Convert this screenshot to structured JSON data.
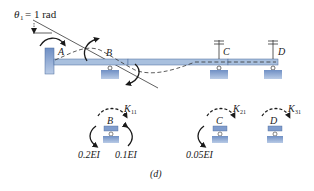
{
  "diagram": {
    "caption": "(d)",
    "rotation_label": {
      "symbol": "θ",
      "subscript": "1",
      "text": "= 1 rad"
    },
    "beam": {
      "nodes": [
        {
          "id": "A",
          "label": "A",
          "support": "fixed"
        },
        {
          "id": "B",
          "label": "B",
          "support": "roller"
        },
        {
          "id": "C",
          "label": "C",
          "support": "roller-restrained"
        },
        {
          "id": "D",
          "label": "D",
          "support": "roller-restrained"
        }
      ],
      "colors": {
        "beam": "#9fb8d8",
        "beam_edge": "#4a6a9a",
        "support": "#7f9ccc",
        "line": "#1a1a1a"
      }
    },
    "free_bodies": [
      {
        "node": "B",
        "label": "B",
        "k_symbol": "K",
        "k_subscript": "11",
        "moments": [
          "0.2EI",
          "0.1EI"
        ]
      },
      {
        "node": "C",
        "label": "C",
        "k_symbol": "K",
        "k_subscript": "21",
        "moments": [
          "0.05EI"
        ]
      },
      {
        "node": "D",
        "label": "D",
        "k_symbol": "K",
        "k_subscript": "31",
        "moments": []
      }
    ]
  }
}
